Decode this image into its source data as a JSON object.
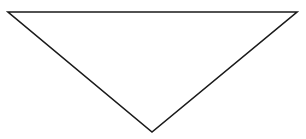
{
  "diagram": {
    "shape": "inverted-triangle",
    "vertices": [
      {
        "x": 8,
        "y": 12
      },
      {
        "x": 297,
        "y": 12
      },
      {
        "x": 152,
        "y": 132
      }
    ],
    "stroke_color": "#1a1a1a",
    "fill_color": "#ffffff",
    "stroke_width": 1.6,
    "background_color": "#ffffff"
  }
}
